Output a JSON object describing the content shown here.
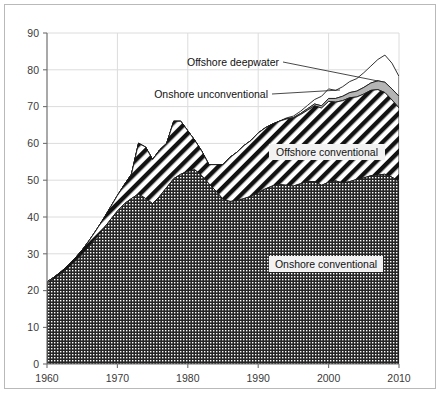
{
  "chart_data": {
    "type": "area",
    "stacked": true,
    "title": "",
    "subtitle": "",
    "xlabel": "",
    "ylabel": "",
    "xlim": [
      1960,
      2010
    ],
    "ylim": [
      0,
      90
    ],
    "xticks": [
      1960,
      1970,
      1980,
      1990,
      2000,
      2010
    ],
    "yticks": [
      0,
      10,
      20,
      30,
      40,
      50,
      60,
      70,
      80,
      90
    ],
    "grid": "horizontal-and-vertical",
    "legend_position": "inline-annotations",
    "x": [
      1960,
      1961,
      1962,
      1963,
      1964,
      1965,
      1966,
      1967,
      1968,
      1969,
      1970,
      1971,
      1972,
      1973,
      1974,
      1975,
      1976,
      1977,
      1978,
      1979,
      1980,
      1981,
      1982,
      1983,
      1984,
      1985,
      1986,
      1987,
      1988,
      1989,
      1990,
      1991,
      1992,
      1993,
      1994,
      1995,
      1996,
      1997,
      1998,
      1999,
      2000,
      2001,
      2002,
      2003,
      2004,
      2005,
      2006,
      2007,
      2008,
      2009,
      2010
    ],
    "series": [
      {
        "name": "Onshore conventional",
        "pattern": "dense-checker",
        "color": "#2b2b2b",
        "values": [
          22.0,
          23.2,
          24.6,
          26.1,
          27.9,
          29.8,
          32.0,
          34.3,
          36.7,
          39.2,
          41.6,
          43.6,
          45.0,
          46.2,
          45.0,
          43.6,
          45.6,
          48.0,
          50.4,
          51.6,
          52.4,
          52.8,
          51.2,
          49.0,
          47.0,
          44.8,
          44.2,
          44.4,
          45.0,
          45.6,
          46.6,
          47.6,
          48.4,
          48.8,
          48.6,
          48.4,
          49.0,
          49.6,
          49.6,
          48.6,
          49.4,
          49.8,
          49.2,
          49.6,
          50.2,
          50.6,
          51.2,
          51.4,
          51.6,
          50.8,
          49.6
        ]
      },
      {
        "name": "Offshore conventional",
        "pattern": "diagonal-hatch",
        "color": "#ffffff",
        "values": [
          0.3,
          0.4,
          0.5,
          0.7,
          0.9,
          1.2,
          1.6,
          2.1,
          2.7,
          3.4,
          4.2,
          5.2,
          6.6,
          13.8,
          14.0,
          12.0,
          12.6,
          12.0,
          15.6,
          14.4,
          11.0,
          8.0,
          6.6,
          5.2,
          7.2,
          9.4,
          12.0,
          13.2,
          14.4,
          15.2,
          16.2,
          16.6,
          16.8,
          17.2,
          18.0,
          18.4,
          18.8,
          19.4,
          20.6,
          21.0,
          22.0,
          21.4,
          22.4,
          22.8,
          22.4,
          22.8,
          23.2,
          23.2,
          22.2,
          21.0,
          20.0
        ]
      },
      {
        "name": "Onshore unconventional",
        "pattern": "solid-gray",
        "color": "#b5b5b5",
        "values": [
          0.0,
          0.0,
          0.0,
          0.0,
          0.0,
          0.0,
          0.0,
          0.0,
          0.0,
          0.0,
          0.0,
          0.0,
          0.0,
          0.0,
          0.0,
          0.0,
          0.0,
          0.0,
          0.0,
          0.0,
          0.0,
          0.0,
          0.0,
          0.0,
          0.0,
          0.0,
          0.0,
          0.0,
          0.0,
          0.0,
          0.0,
          0.0,
          0.0,
          0.0,
          0.1,
          0.2,
          0.3,
          0.4,
          0.5,
          0.6,
          0.8,
          1.0,
          1.2,
          1.4,
          1.6,
          1.8,
          2.0,
          2.4,
          2.8,
          3.0,
          3.2
        ]
      },
      {
        "name": "Offshore deepwater",
        "pattern": "white-outline",
        "color": "#ffffff",
        "values": [
          0.0,
          0.0,
          0.0,
          0.0,
          0.0,
          0.0,
          0.0,
          0.0,
          0.0,
          0.0,
          0.0,
          0.0,
          0.0,
          0.0,
          0.0,
          0.0,
          0.0,
          0.0,
          0.0,
          0.0,
          0.0,
          0.0,
          0.0,
          0.0,
          0.0,
          0.0,
          0.0,
          0.0,
          0.0,
          0.0,
          0.0,
          0.0,
          0.0,
          0.0,
          0.2,
          0.4,
          0.6,
          0.9,
          1.2,
          2.6,
          2.6,
          2.2,
          2.6,
          3.0,
          3.4,
          4.0,
          4.6,
          5.8,
          7.4,
          7.0,
          5.4
        ]
      }
    ],
    "annotations": [
      {
        "name": "offshore-deepwater",
        "label": "Offshore deepwater",
        "style": "leader-line"
      },
      {
        "name": "onshore-unconventional",
        "label": "Onshore unconventional",
        "style": "leader-line"
      },
      {
        "name": "offshore-conventional",
        "label": "Offshore conventional",
        "style": "boxed-inline"
      },
      {
        "name": "onshore-conventional",
        "label": "Onshore conventional",
        "style": "boxed-inline"
      }
    ],
    "colors": {
      "grid": "#d9d9d9",
      "axis": "#6e6e6e",
      "frame": "#b9b9b9",
      "tick_text": "#3a3a3a",
      "unconventional_gray": "#b5b5b5",
      "conventional_dark": "#2b2b2b"
    }
  },
  "axes": {
    "y_tick_labels": [
      "0",
      "10",
      "20",
      "30",
      "40",
      "50",
      "60",
      "70",
      "80",
      "90"
    ],
    "x_tick_labels": [
      "1960",
      "1970",
      "1980",
      "1990",
      "2000",
      "2010"
    ]
  },
  "labels": {
    "offshore_deepwater": "Offshore deepwater",
    "onshore_unconventional": "Onshore unconventional",
    "offshore_conventional": "Offshore conventional",
    "onshore_conventional": "Onshore conventional"
  },
  "caption": {
    "text": ""
  }
}
